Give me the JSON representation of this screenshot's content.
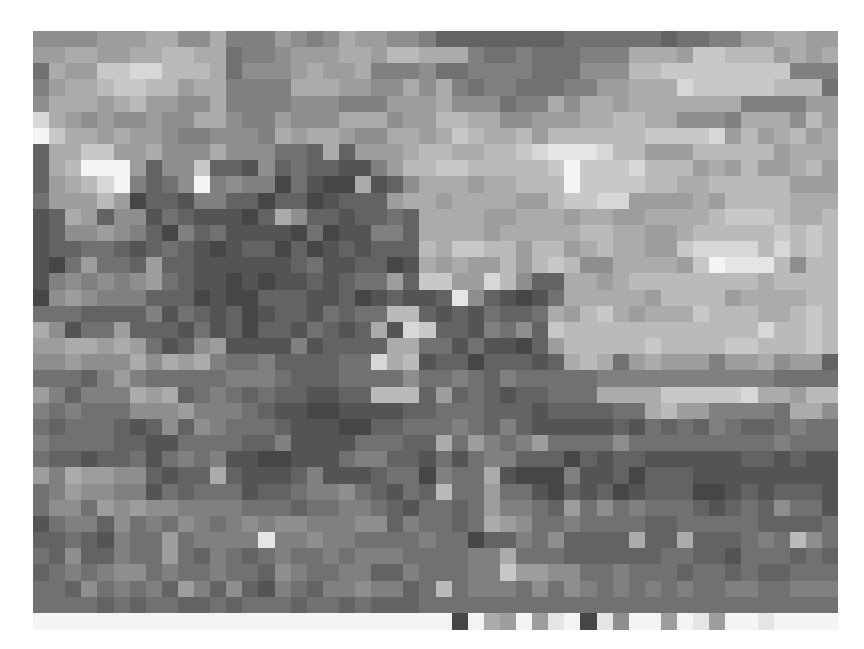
{
  "image": {
    "description": "Pixelated grayscale photograph mosaic",
    "columns": 50,
    "rows": 36,
    "palette_levels": "0 = darkest (#1a1a1a) ... f = lightest (#f4f4f4)",
    "grid": [
      "8888999aa88a7779878a99887555555556666665667799aa99",
      "99aa99aabbaa6778999aa9bbaaa7667666777aaa9ccbbb9a9a",
      "6a99ccddbbba68889a99a7778667777666888bbcccccccc777",
      "79aabccbb9aa7777aaa9988a8a76776667799aaadcccccbbb6",
      "8aaa9ab9988a7777888777999a888677a8aa9aaaaaaa7777998",
      "da98988988aa8779888aaa899bbaa88999aabbaa8887aaa8b9",
      "fcaa9a998778887a9aa988aa9acbaab9bbbbbbccccd9b9ab9a",
      "5aacc99a888a888665a5999abbaabbcdeeedbb999bbbbb9aaa",
      "5abfff9588c554856554479bbccbbbbbcfcccdbbb9a9b99ab9",
      "59abdf7568f787736433a458aaa9aabbbfccccbbaabbbbb999",
      "6999b935547755355345559aa9aaaa99bccdd9999a9bbbbaaa",
      "45a958846544435a85545565aaaa99aaa9aa99aaaabcccbaab",
      "458898753756444436344775aaaa9aaaaabbaa99abbbbbcbcb",
      "455665456543455353454555baccbb9bb9abaa99cddddbdbcb",
      "436966595544444456445534a9a99b9bcb88aaaa9cfeeeb8bb",
      "478787896544343445456695cc99db855aa9abbbbbbbbabbbb",
      "38987775553433555445345445e854346aaaaa9bbbb9aaaabbb",
      "6665555746545345546566bb54546556a9bca9aaacbbbaabcbb",
      "a84669555464535546545a4dc5547685cbbbbbbbbbbbbdbbcbb",
      "99aa9a9645894444745555aa664644359bbbbbcbbbbccbbbcbb",
      "889888a8a9a7667555566dab455355545aba69a999799a89959",
      "666579766666777655566668667657666667777777777766666",
      "975777a9a567656554455bbb59565455666aaaacccccdaa9bba",
      "76766688897776544334444556665554555566ab9977776aa88",
      "656665458587666544433556667657544444546565765567666",
      "7666655446666557444466655a69767966668666666666766666",
      "6554556467674433444677554646775553545544444455454455",
      "97a99885455a5444574445663766a43337445355544444444454",
      "6798877465666455677865465b66966435453455533454555444",
      "6886989887777666566776546656977659686766654565866455",
      "4677586768767878877788576656a986676666556666655556787",
      "55654766967777e7787766667663557685555a55a555676b867",
      "65855766965765676676777666677a6665555556655466656566",
      "56767886766766587667755766677c99886676665665655666b8",
      "6658676759758547657787756b6777686876767676677667776",
      "66665656655656665665655566666666666666666666666666"
    ],
    "bottom_strip": "ffffffffffffffffffffffffff3fa9f9ef3e8ff9fe9ffeffff"
  }
}
